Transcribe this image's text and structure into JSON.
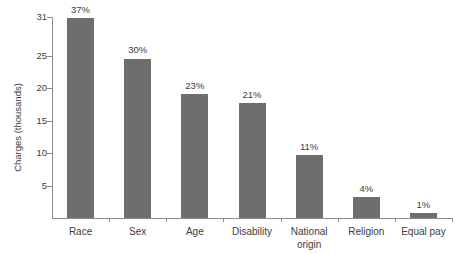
{
  "chart_data": {
    "type": "bar",
    "title": "",
    "xlabel": "",
    "ylabel": "Charges (thousands)",
    "categories": [
      "Race",
      "Sex",
      "Age",
      "Disability",
      "National\norigin",
      "Religion",
      "Equal pay"
    ],
    "values": [
      30.8,
      24.6,
      19.2,
      17.7,
      9.7,
      3.3,
      0.8
    ],
    "data_labels": [
      "37%",
      "30%",
      "23%",
      "21%",
      "11%",
      "4%",
      "1%"
    ],
    "ylim": [
      0,
      31
    ],
    "yticks": [
      5,
      10,
      15,
      20,
      25,
      31
    ],
    "ytick_labels": [
      "5",
      "10",
      "15",
      "20",
      "25",
      "31"
    ],
    "grid": false,
    "legend": false,
    "bar_color": "#6e6e6e",
    "axis_color": "#8c8c8c",
    "text_color": "#3d3d3d",
    "background_color": "#ffffff"
  }
}
